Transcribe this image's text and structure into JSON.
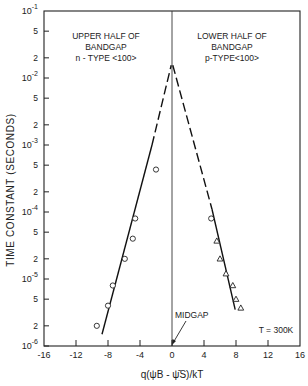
{
  "chart_data": {
    "type": "scatter",
    "title": "",
    "xlabel": "q(ψB - ψ̄S)/kT",
    "ylabel": "TIME CONSTANT (SECONDS)",
    "xlim": [
      -16,
      16
    ],
    "ylim": [
      1e-06,
      0.1
    ],
    "yscale": "log",
    "grid": false,
    "x_ticks": [
      -16,
      -12,
      -8,
      -4,
      0,
      4,
      8,
      12,
      16
    ],
    "x_tick_labels": [
      "-16",
      "-12",
      "-8",
      "-4",
      "0",
      "4",
      "8",
      "12",
      "16"
    ],
    "y_decades": [
      {
        "value": 0.1,
        "exp": "-1"
      },
      {
        "value": 0.01,
        "exp": "-2"
      },
      {
        "value": 0.001,
        "exp": "-3"
      },
      {
        "value": 0.0001,
        "exp": "-4"
      },
      {
        "value": 1e-05,
        "exp": "-5"
      },
      {
        "value": 1e-06,
        "exp": "-6"
      }
    ],
    "y_minor_labels": [
      "5",
      "2"
    ],
    "annotations": {
      "left_region": [
        "UPPER HALF OF",
        "BANDGAP",
        "n - TYPE <100>"
      ],
      "right_region": [
        "LOWER HALF OF",
        "BANDGAP",
        "p-TYPE<100>"
      ],
      "midgap": "MIDGAP",
      "temperature": "T = 300K"
    },
    "series": [
      {
        "name": "n-type <100> (upper half of bandgap)",
        "marker": "circle",
        "points": [
          {
            "x": -9.4,
            "y": 2e-06
          },
          {
            "x": -8.0,
            "y": 4e-06
          },
          {
            "x": -7.4,
            "y": 8e-06
          },
          {
            "x": -5.9,
            "y": 2e-05
          },
          {
            "x": -4.9,
            "y": 4e-05
          },
          {
            "x": -4.6,
            "y": 8e-05
          },
          {
            "x": -2.0,
            "y": 0.00043
          }
        ]
      },
      {
        "name": "p-type <100> (lower half of bandgap)",
        "marker": "triangle",
        "points": [
          {
            "x": 4.9,
            "y": 8e-05,
            "marker": "circle"
          },
          {
            "x": 5.6,
            "y": 3.7e-05
          },
          {
            "x": 6.0,
            "y": 2e-05
          },
          {
            "x": 6.75,
            "y": 1.2e-05
          },
          {
            "x": 7.6,
            "y": 8e-06
          },
          {
            "x": 8.0,
            "y": 5e-06
          },
          {
            "x": 8.6,
            "y": 3.7e-06
          }
        ]
      }
    ],
    "fit_lines": [
      {
        "name": "left-fit",
        "solid": [
          {
            "x": -8.75,
            "y": 1.5e-06
          },
          {
            "x": -2.5,
            "y": 0.001
          }
        ],
        "dashed": [
          {
            "x": -2.5,
            "y": 0.001
          },
          {
            "x": -0.1,
            "y": 0.0155
          }
        ]
      },
      {
        "name": "right-fit",
        "solid": [
          {
            "x": 5.0,
            "y": 0.00011
          },
          {
            "x": 7.9,
            "y": 3.5e-06
          }
        ],
        "dashed": [
          {
            "x": 0.1,
            "y": 0.0155
          },
          {
            "x": 5.0,
            "y": 0.00011
          }
        ]
      }
    ],
    "midgap_line_x": 0
  }
}
